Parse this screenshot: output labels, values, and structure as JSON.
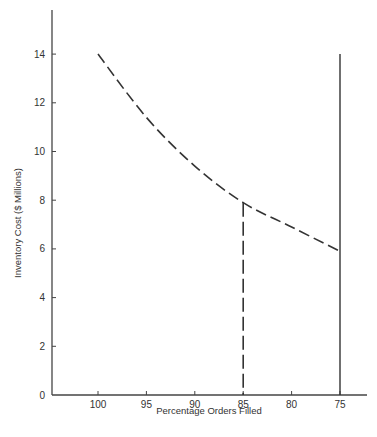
{
  "chart_data": {
    "type": "line",
    "title": "",
    "xlabel": "Percentage Orders Filled",
    "ylabel": "Inventory Cost ($ Millions)",
    "x_ticks": [
      100,
      95,
      90,
      85,
      80,
      75
    ],
    "y_ticks": [
      0,
      2,
      4,
      6,
      8,
      10,
      12,
      14
    ],
    "xlim": [
      102,
      72
    ],
    "ylim": [
      0,
      15.5
    ],
    "x_reversed": true,
    "grid": false,
    "series": [
      {
        "name": "Inventory cost curve",
        "style": "dashed",
        "x": [
          100,
          95,
          90,
          85,
          80,
          75
        ],
        "y": [
          14.0,
          11.4,
          9.4,
          7.9,
          6.9,
          5.9
        ]
      }
    ],
    "reference_lines": [
      {
        "name": "85% service level",
        "x": 85,
        "y_from": 0,
        "y_to": 7.9,
        "style": "dashed"
      },
      {
        "name": "75% service level",
        "x": 75,
        "y_from": 0,
        "y_to": 14.0,
        "style": "solid"
      }
    ],
    "colors": {
      "line": "#333333",
      "axis": "#444444",
      "background": "#ffffff"
    }
  }
}
